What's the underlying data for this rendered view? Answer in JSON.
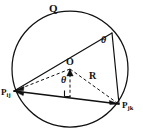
{
  "figure": {
    "type": "geometry-diagram",
    "background_color": "#ffffff",
    "stroke_color": "#101010"
  },
  "labels": {
    "circle_name": "Q",
    "center": "O",
    "radius": "R",
    "inscribed_angle": "θ",
    "central_half_angle": "θ",
    "point_left": {
      "base": "P",
      "subscript": "ij"
    },
    "point_right": {
      "base": "P",
      "subscript": "jk"
    }
  },
  "geometry": {
    "circle": {
      "cx": 70,
      "cy": 69,
      "r": 58
    },
    "center_point": {
      "x": 70,
      "y": 69
    },
    "points": {
      "P_ij": {
        "x": 14,
        "y": 91
      },
      "P_jk": {
        "x": 119,
        "y": 104
      },
      "apex": {
        "x": 112,
        "y": 33
      }
    },
    "foot_of_perpendicular": {
      "x": 70,
      "y": 96
    },
    "right_angle_marker": {
      "x": 70,
      "y": 96,
      "size": 6
    },
    "solid_segments": [
      {
        "name": "chord-Pij-Pjk",
        "from": "P_ij",
        "to": "P_jk"
      },
      {
        "name": "chord-Pij-apex",
        "from": "P_ij",
        "to": "apex"
      },
      {
        "name": "chord-apex-Pjk",
        "from": "apex",
        "to": "P_jk"
      }
    ],
    "dashed_segments": [
      {
        "name": "radius-O-Pij",
        "from": "center",
        "to": "P_ij"
      },
      {
        "name": "radius-O-Pjk",
        "from": "center",
        "to": "P_jk"
      },
      {
        "name": "perpendicular-O-chord",
        "from": "center",
        "to": "foot"
      }
    ],
    "arrowheads": [
      {
        "name": "arrow-to-Pij",
        "at": "P_ij"
      },
      {
        "name": "arrow-to-Pjk",
        "at": "P_jk"
      },
      {
        "name": "arrow-to-center",
        "at": "center"
      }
    ]
  }
}
